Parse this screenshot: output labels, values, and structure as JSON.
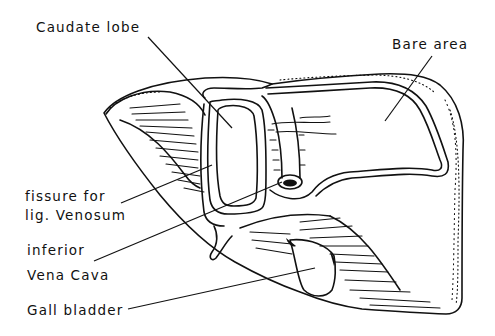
{
  "diagram": {
    "ink_color": "#111111",
    "background_color": "#ffffff",
    "labels": [
      {
        "id": "caudate-lobe",
        "text": "Caudate lobe"
      },
      {
        "id": "bare-area",
        "text": "Bare area"
      },
      {
        "id": "fissure-line1",
        "text": "fissure for"
      },
      {
        "id": "fissure-line2",
        "text": "lig. Venosum"
      },
      {
        "id": "ivc-line1",
        "text": "inferior"
      },
      {
        "id": "ivc-line2",
        "text": "Vena Cava"
      },
      {
        "id": "gall-bladder",
        "text": "Gall bladder"
      }
    ]
  }
}
